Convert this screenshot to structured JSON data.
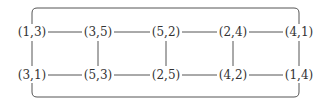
{
  "diagram": {
    "type": "graph",
    "line_color": "#555555",
    "top_row": [
      {
        "id": "n13",
        "label": "(1,3)",
        "x": 32,
        "y": 32
      },
      {
        "id": "n35",
        "label": "(3,5)",
        "x": 98,
        "y": 32
      },
      {
        "id": "n52",
        "label": "(5,2)",
        "x": 166,
        "y": 32
      },
      {
        "id": "n24",
        "label": "(2,4)",
        "x": 233,
        "y": 32
      },
      {
        "id": "n41",
        "label": "(4,1)",
        "x": 299,
        "y": 32
      }
    ],
    "bottom_row": [
      {
        "id": "n31",
        "label": "(3,1)",
        "x": 32,
        "y": 75
      },
      {
        "id": "n53",
        "label": "(5,3)",
        "x": 98,
        "y": 75
      },
      {
        "id": "n25",
        "label": "(2,5)",
        "x": 166,
        "y": 75
      },
      {
        "id": "n42",
        "label": "(4,2)",
        "x": 233,
        "y": 75
      },
      {
        "id": "n14",
        "label": "(1,4)",
        "x": 299,
        "y": 75
      }
    ],
    "edges": [
      [
        "(1,3)",
        "(3,5)"
      ],
      [
        "(3,5)",
        "(5,2)"
      ],
      [
        "(5,2)",
        "(2,4)"
      ],
      [
        "(2,4)",
        "(4,1)"
      ],
      [
        "(3,1)",
        "(5,3)"
      ],
      [
        "(5,3)",
        "(2,5)"
      ],
      [
        "(2,5)",
        "(4,2)"
      ],
      [
        "(4,2)",
        "(1,4)"
      ],
      [
        "(1,3)",
        "(3,1)"
      ],
      [
        "(3,5)",
        "(5,3)"
      ],
      [
        "(5,2)",
        "(2,5)"
      ],
      [
        "(2,4)",
        "(4,2)"
      ],
      [
        "(4,1)",
        "(1,4)"
      ]
    ],
    "outer_frame": "rounded rectangle connecting (1,3)/(3,1) on the left with (4,1)/(1,4) on the right"
  }
}
